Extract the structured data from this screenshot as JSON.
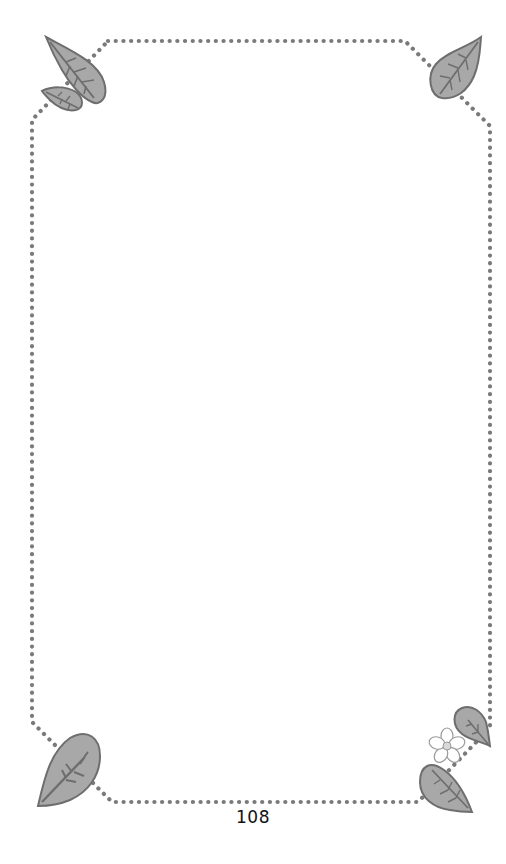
{
  "page": {
    "page_number": "108",
    "background": "#ffffff"
  },
  "frame": {
    "style": "dotted",
    "dot_color": "#7a7a7a"
  },
  "decorations": {
    "leaf_fill": "#a8a8a8",
    "leaf_stroke": "#6e6e6e",
    "flower_fill": "#ffffff",
    "flower_center": "#d9d9d9",
    "items": [
      {
        "name": "top-left-leaves",
        "count": 2
      },
      {
        "name": "top-right-leaf",
        "count": 1
      },
      {
        "name": "bottom-left-leaf",
        "count": 1
      },
      {
        "name": "bottom-right-leaves-with-flower",
        "count": 2
      }
    ]
  },
  "content": {
    "body_text": ""
  }
}
